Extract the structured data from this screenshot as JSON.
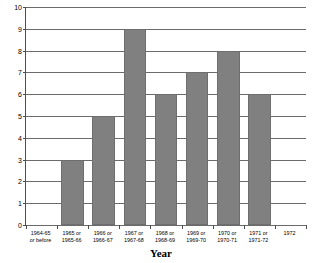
{
  "chart_data": {
    "type": "bar",
    "title": "",
    "xlabel": "Year",
    "ylabel": "",
    "ylim": [
      0,
      10
    ],
    "ytick_step": 1,
    "grid": true,
    "legend": "none",
    "bar_color": "#808080",
    "categories": [
      "1964-65\nor before",
      "1965 or\n1965-66",
      "1966 or\n1966-67",
      "1967 or\n1967-68",
      "1968 or\n1968-69",
      "1969 or\n1969-70",
      "1970 or\n1970-71",
      "1971 or\n1971-72",
      "1972"
    ],
    "values": [
      0,
      3,
      5,
      9,
      6,
      7,
      8,
      6,
      0
    ],
    "yticks": [
      "10",
      "9",
      "8",
      "7",
      "6",
      "5",
      "4",
      "3",
      "2",
      "1",
      "0"
    ]
  }
}
